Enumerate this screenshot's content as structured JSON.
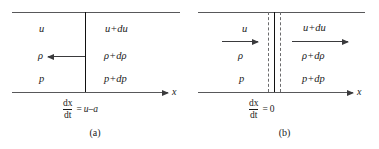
{
  "figure": {
    "panels": [
      {
        "id": "a",
        "caption": "(a)",
        "left_state": {
          "velocity": "u",
          "density": "ρ",
          "pressure": "p"
        },
        "right_state": {
          "velocity": "u+du",
          "density": "ρ+dρ",
          "pressure": "p+dp"
        },
        "axis_label": "x",
        "wave_speed_equation": {
          "numerator": "dx",
          "denominator": "dt",
          "equals": "=",
          "rhs": "u–a"
        },
        "arrows": [
          {
            "name": "left-flow-arrow",
            "label": "",
            "direction": "left"
          }
        ]
      },
      {
        "id": "b",
        "caption": "(b)",
        "left_state": {
          "velocity": "u",
          "density": "ρ",
          "pressure": "p"
        },
        "right_state": {
          "velocity": "u+du",
          "density": "ρ+dρ",
          "pressure": "p+dp"
        },
        "axis_label": "x",
        "wave_speed_equation": {
          "numerator": "dx",
          "denominator": "dt",
          "equals": "=",
          "rhs": "0"
        },
        "arrows": [
          {
            "name": "upstream-flow-arrow",
            "label": "u",
            "direction": "right"
          },
          {
            "name": "downstream-flow-arrow",
            "label": "u+du",
            "direction": "right"
          }
        ]
      }
    ],
    "colors": {
      "rule": "#58585a",
      "wave_line": "#111111",
      "dashed_line": "#6b6b6d",
      "arrow": "#3a3a3c",
      "text": "#1a1a1a",
      "background": "#ffffff"
    }
  }
}
